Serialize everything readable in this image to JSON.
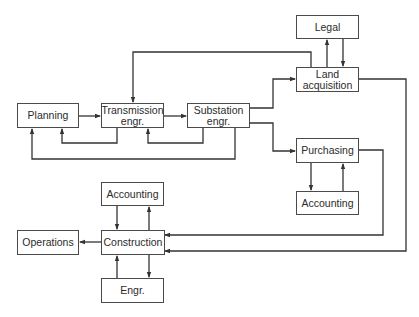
{
  "diagram": {
    "type": "flow",
    "line_color": "#333333",
    "nodes": {
      "planning": "Planning",
      "transmission": "Transmission\nengr.",
      "substation": "Substation\nengr.",
      "legal": "Legal",
      "land": "Land\nacquisition",
      "purchasing": "Purchasing",
      "accounting_right": "Accounting",
      "accounting_left": "Accounting",
      "operations": "Operations",
      "construction": "Construction",
      "engr": "Engr."
    },
    "edges": [
      {
        "from": "Planning",
        "to": "Transmission engr."
      },
      {
        "from": "Transmission engr.",
        "to": "Planning"
      },
      {
        "from": "Transmission engr.",
        "to": "Substation engr."
      },
      {
        "from": "Substation engr.",
        "to": "Transmission engr."
      },
      {
        "from": "Substation engr.",
        "to": "Planning"
      },
      {
        "from": "Substation engr.",
        "to": "Land acquisition"
      },
      {
        "from": "Substation engr.",
        "to": "Purchasing"
      },
      {
        "from": "Land acquisition",
        "to": "Transmission engr."
      },
      {
        "from": "Land acquisition",
        "to": "Legal"
      },
      {
        "from": "Legal",
        "to": "Land acquisition"
      },
      {
        "from": "Land acquisition",
        "to": "Construction"
      },
      {
        "from": "Purchasing",
        "to": "Accounting"
      },
      {
        "from": "Accounting",
        "to": "Purchasing"
      },
      {
        "from": "Purchasing",
        "to": "Construction"
      },
      {
        "from": "Construction",
        "to": "Accounting"
      },
      {
        "from": "Accounting",
        "to": "Construction"
      },
      {
        "from": "Construction",
        "to": "Engr."
      },
      {
        "from": "Engr.",
        "to": "Construction"
      },
      {
        "from": "Construction",
        "to": "Operations"
      }
    ]
  }
}
